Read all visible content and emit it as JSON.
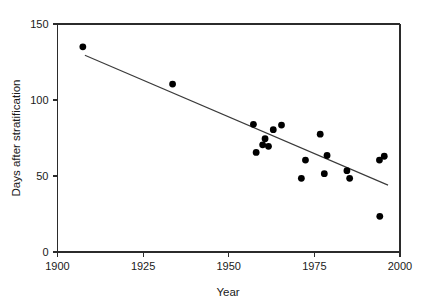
{
  "chart_data": {
    "type": "scatter",
    "title": "",
    "subtitle": "",
    "xlabel": "Year",
    "ylabel": "Days after stratification",
    "xlim": [
      1900,
      2000
    ],
    "ylim": [
      0,
      150
    ],
    "xticks": [
      1900,
      1925,
      1950,
      1975,
      2000
    ],
    "xtick_labels": [
      "1900",
      "1925",
      "1950",
      "1975",
      "2000"
    ],
    "yticks": [
      0,
      50,
      100,
      150
    ],
    "ytick_labels": [
      "0",
      "50",
      "100",
      "150"
    ],
    "grid": false,
    "legend": null,
    "legend_position": "none",
    "marker_color": "#000000",
    "marker_shape": "circle",
    "axis_color": "#2b2b2b",
    "series": [
      {
        "name": "Days after stratification",
        "type": "scatter",
        "points": [
          {
            "x": 1907.4,
            "y": 135.0
          },
          {
            "x": 1933.6,
            "y": 110.5
          },
          {
            "x": 1957.2,
            "y": 84.0
          },
          {
            "x": 1958.0,
            "y": 65.5
          },
          {
            "x": 1959.9,
            "y": 70.5
          },
          {
            "x": 1960.6,
            "y": 74.5
          },
          {
            "x": 1961.6,
            "y": 69.5
          },
          {
            "x": 1963.0,
            "y": 80.5
          },
          {
            "x": 1965.4,
            "y": 83.5
          },
          {
            "x": 1971.2,
            "y": 48.5
          },
          {
            "x": 1972.4,
            "y": 60.5
          },
          {
            "x": 1976.7,
            "y": 77.5
          },
          {
            "x": 1977.9,
            "y": 51.5
          },
          {
            "x": 1978.7,
            "y": 63.5
          },
          {
            "x": 1984.5,
            "y": 53.5
          },
          {
            "x": 1985.3,
            "y": 48.5
          },
          {
            "x": 1994.0,
            "y": 60.5
          },
          {
            "x": 1994.1,
            "y": 23.5
          },
          {
            "x": 1995.4,
            "y": 63.0
          }
        ]
      },
      {
        "name": "trend-line",
        "type": "line",
        "points": [
          {
            "x": 1908.0,
            "y": 129.5
          },
          {
            "x": 1996.5,
            "y": 44.0
          }
        ]
      }
    ]
  }
}
